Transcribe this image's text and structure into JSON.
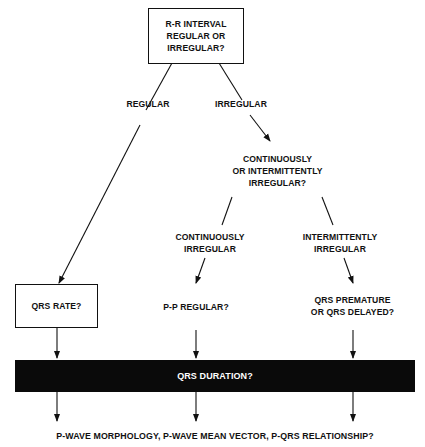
{
  "diagram": {
    "title_box": "R-R INTERVAL\nREGULAR OR\nIRREGULAR?",
    "branch_regular": "REGULAR",
    "branch_irregular": "IRREGULAR",
    "continuity_question": "CONTINUOUSLY\nOR INTERMITTENTLY\nIRREGULAR?",
    "branch_continuously": "CONTINUOUSLY\nIRREGULAR",
    "branch_intermittently": "INTERMITTENTLY\nIRREGULAR",
    "qrs_rate_box": "QRS RATE?",
    "pp_regular": "P-P REGULAR?",
    "qrs_premature": "QRS PREMATURE\nOR QRS DELAYED?",
    "qrs_duration_bar": "QRS DURATION?",
    "final_question": "P-WAVE MORPHOLOGY, P-WAVE MEAN VECTOR, P-QRS RELATIONSHIP?",
    "colors": {
      "ink": "#111111",
      "bar": "#0a0a0a",
      "bar_text": "#ffffff",
      "background": "#ffffff"
    }
  }
}
